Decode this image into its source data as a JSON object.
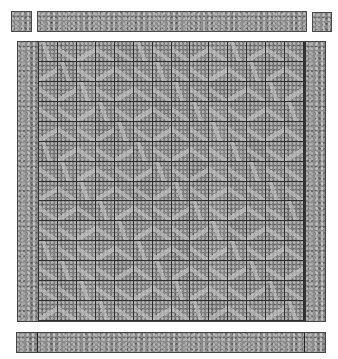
{
  "image": {
    "description": "Grid of grayscale texture tiles",
    "grid": {
      "rows": 14,
      "columns": 14
    },
    "colors": {
      "tile": "#8c8c8c",
      "grid_line": "#2e2e2e",
      "background": "#ffffff"
    }
  }
}
